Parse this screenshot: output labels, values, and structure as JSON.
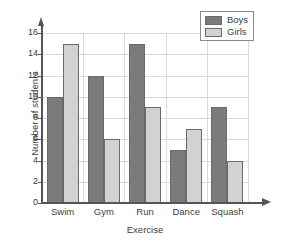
{
  "chart_data": {
    "type": "bar",
    "title": "",
    "xlabel": "Exercise",
    "ylabel": "Number of students",
    "categories": [
      "Swim",
      "Gym",
      "Run",
      "Dance",
      "Squash"
    ],
    "series": [
      {
        "name": "Boys",
        "color": "#7b7b7b",
        "values": [
          10,
          12,
          15,
          5,
          9
        ]
      },
      {
        "name": "Girls",
        "color": "#d2d2d2",
        "values": [
          15,
          6,
          9,
          7,
          4
        ]
      }
    ],
    "ylim": [
      0,
      16
    ],
    "yticks": [
      0,
      2,
      4,
      6,
      8,
      10,
      12,
      14,
      16
    ],
    "ytick_labels": [
      "0",
      "2",
      "4",
      "6",
      "8",
      "10",
      "12",
      "14",
      "16"
    ],
    "grid": true,
    "grid_axis": "both",
    "legend_position": "top-right",
    "bar_style": "grouped-adjacent"
  },
  "legend": {
    "entries": [
      {
        "label": "Boys",
        "swatch": "boys-swatch"
      },
      {
        "label": "Girls",
        "swatch": "girls-swatch"
      }
    ]
  },
  "axes": {
    "y_title": "Number of students",
    "x_title": "Exercise"
  }
}
